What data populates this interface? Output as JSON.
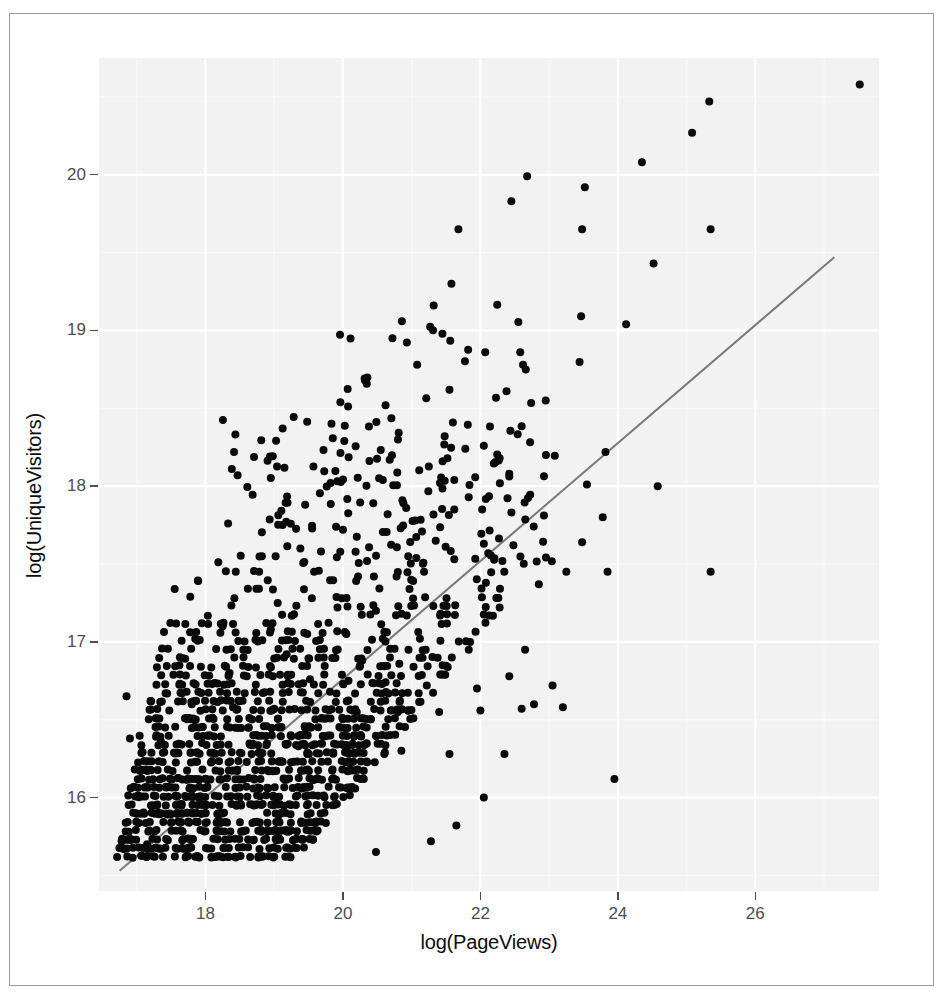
{
  "chart": {
    "type": "scatter",
    "title": "",
    "xlabel": "log(PageViews)",
    "ylabel": "log(UniqueVisitors)",
    "x_ticks": [
      18,
      20,
      22,
      24,
      26
    ],
    "y_ticks": [
      16,
      17,
      18,
      19,
      20
    ],
    "x_tick_labels": [
      "18",
      "20",
      "22",
      "24",
      "26"
    ],
    "y_tick_labels": [
      "16",
      "17",
      "18",
      "19",
      "20"
    ],
    "xlim": [
      16.45,
      27.8
    ],
    "ylim": [
      15.4,
      20.75
    ],
    "grid": true,
    "grid_major_color": "#ffffff",
    "grid_minor_color": "#f8f8f8",
    "panel_color": "#f2f2f2",
    "point_color": "#0a0a0a",
    "point_size": 8,
    "legend": "none",
    "fit_line": {
      "type": "linear",
      "color": "#7a7a7a",
      "x_start": 16.75,
      "y_start": 15.53,
      "x_end": 27.15,
      "y_end": 19.47
    }
  },
  "chart_data": {
    "type": "scatter",
    "title": "",
    "xlabel": "log(PageViews)",
    "ylabel": "log(UniqueVisitors)",
    "xlim": [
      16.45,
      27.8
    ],
    "ylim": [
      15.4,
      20.75
    ],
    "xticks": [
      18,
      20,
      22,
      24,
      26
    ],
    "yticks": [
      16,
      17,
      18,
      19,
      20
    ],
    "grid": true,
    "legend": "none",
    "series": [
      {
        "name": "websites",
        "marker": "filled-circle",
        "color": "#0a0a0a",
        "note": "n ~ 1000; y values discretized into horizontal bands",
        "points": [
          [
            27.52,
            20.58
          ],
          [
            25.33,
            20.47
          ],
          [
            25.08,
            20.27
          ],
          [
            24.35,
            20.08
          ],
          [
            22.68,
            19.99
          ],
          [
            23.52,
            19.92
          ],
          [
            22.45,
            19.83
          ],
          [
            24.52,
            19.43
          ],
          [
            25.35,
            19.65
          ],
          [
            23.48,
            19.65
          ],
          [
            21.68,
            19.65
          ],
          [
            24.12,
            19.04
          ],
          [
            21.32,
            19.16
          ],
          [
            20.72,
            18.95
          ],
          [
            22.07,
            18.86
          ],
          [
            22.58,
            18.86
          ],
          [
            22.62,
            18.78
          ],
          [
            22.66,
            18.75
          ],
          [
            20.32,
            18.68
          ],
          [
            21.55,
            18.62
          ],
          [
            22.38,
            18.61
          ],
          [
            22.95,
            18.55
          ],
          [
            20.62,
            18.52
          ],
          [
            21.48,
            18.32
          ],
          [
            20.02,
            18.29
          ],
          [
            22.05,
            18.26
          ],
          [
            21.78,
            18.24
          ],
          [
            21.52,
            18.18
          ],
          [
            22.28,
            18.18
          ],
          [
            20.68,
            18.17
          ],
          [
            23.82,
            18.22
          ],
          [
            22.42,
            18.08
          ],
          [
            21.62,
            18.04
          ],
          [
            20.58,
            18.04
          ],
          [
            19.82,
            18.02
          ],
          [
            23.55,
            18.01
          ],
          [
            24.58,
            18.0
          ],
          [
            19.45,
            17.88
          ],
          [
            20.65,
            17.82
          ],
          [
            20.92,
            17.86
          ],
          [
            21.62,
            17.85
          ],
          [
            21.05,
            17.78
          ],
          [
            23.78,
            17.8
          ],
          [
            19.12,
            17.75
          ],
          [
            20.0,
            17.72
          ],
          [
            21.35,
            17.65
          ],
          [
            22.05,
            17.63
          ],
          [
            22.48,
            17.62
          ],
          [
            19.38,
            17.6
          ],
          [
            19.68,
            17.58
          ],
          [
            18.82,
            17.55
          ],
          [
            19.02,
            17.55
          ],
          [
            20.35,
            17.52
          ],
          [
            20.95,
            17.55
          ],
          [
            21.62,
            17.53
          ],
          [
            22.32,
            17.52
          ],
          [
            23.48,
            17.64
          ],
          [
            22.85,
            17.37
          ],
          [
            23.25,
            17.45
          ],
          [
            23.85,
            17.45
          ],
          [
            25.35,
            17.45
          ],
          [
            18.78,
            17.45
          ],
          [
            19.58,
            17.45
          ],
          [
            20.22,
            17.42
          ],
          [
            20.45,
            17.42
          ],
          [
            20.78,
            17.42
          ],
          [
            21.18,
            17.45
          ],
          [
            22.08,
            17.38
          ],
          [
            18.42,
            17.28
          ],
          [
            19.05,
            17.25
          ],
          [
            19.92,
            17.22
          ],
          [
            20.48,
            17.2
          ],
          [
            20.85,
            17.18
          ],
          [
            21.42,
            17.18
          ],
          [
            22.28,
            17.22
          ],
          [
            18.25,
            17.1
          ],
          [
            18.95,
            17.08
          ],
          [
            19.48,
            17.05
          ],
          [
            20.05,
            17.05
          ],
          [
            20.58,
            17.02
          ],
          [
            21.12,
            17.02
          ],
          [
            21.85,
            17.0
          ],
          [
            22.65,
            16.95
          ],
          [
            17.85,
            17.02
          ],
          [
            18.55,
            16.95
          ],
          [
            19.18,
            16.92
          ],
          [
            19.72,
            16.9
          ],
          [
            20.28,
            16.88
          ],
          [
            20.82,
            16.86
          ],
          [
            21.45,
            16.85
          ],
          [
            22.42,
            16.78
          ],
          [
            23.05,
            16.72
          ],
          [
            17.62,
            16.85
          ],
          [
            18.35,
            16.8
          ],
          [
            18.98,
            16.78
          ],
          [
            19.52,
            16.76
          ],
          [
            20.08,
            16.75
          ],
          [
            20.62,
            16.74
          ],
          [
            21.22,
            16.72
          ],
          [
            21.95,
            16.7
          ],
          [
            22.78,
            16.6
          ],
          [
            23.95,
            16.12
          ],
          [
            22.05,
            16.0
          ],
          [
            21.65,
            15.82
          ],
          [
            21.28,
            15.72
          ],
          [
            20.48,
            15.65
          ],
          [
            19.0,
            15.62
          ],
          [
            17.85,
            15.62
          ],
          [
            17.15,
            15.7
          ],
          [
            16.78,
            15.72
          ],
          [
            22.35,
            16.28
          ],
          [
            21.55,
            16.28
          ],
          [
            20.85,
            16.3
          ],
          [
            20.05,
            16.32
          ],
          [
            19.35,
            16.33
          ],
          [
            18.65,
            16.34
          ],
          [
            17.95,
            16.35
          ],
          [
            17.35,
            16.36
          ],
          [
            16.9,
            16.38
          ],
          [
            23.2,
            16.58
          ],
          [
            22.6,
            16.57
          ],
          [
            22.0,
            16.56
          ],
          [
            21.4,
            16.55
          ],
          [
            20.8,
            16.55
          ],
          [
            20.2,
            16.55
          ],
          [
            19.6,
            16.56
          ],
          [
            19.0,
            16.57
          ],
          [
            18.4,
            16.58
          ],
          [
            17.8,
            16.6
          ],
          [
            17.2,
            16.62
          ],
          [
            16.85,
            16.65
          ]
        ]
      }
    ],
    "fit_line": {
      "type": "linear",
      "color": "#7a7a7a",
      "endpoints": [
        [
          16.75,
          15.53
        ],
        [
          27.15,
          19.47
        ]
      ],
      "slope": 0.379,
      "intercept": 9.18
    }
  },
  "icons": {
    "panel": "plot-panel",
    "regression": "trend-line"
  }
}
